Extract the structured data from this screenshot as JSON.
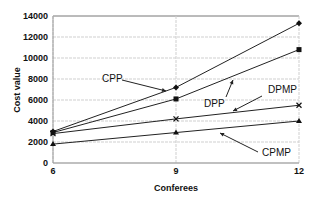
{
  "chart_data": {
    "type": "line",
    "title": "",
    "xlabel": "Conferees",
    "ylabel": "Cost value",
    "x": [
      6,
      9,
      12
    ],
    "xticks": [
      "6",
      "9",
      "12"
    ],
    "yticks": [
      "0",
      "2000",
      "4000",
      "6000",
      "8000",
      "10000",
      "12000",
      "14000"
    ],
    "ylim": [
      0,
      14000
    ],
    "grid": true,
    "legend_position": "inline-annotations",
    "series": [
      {
        "name": "CPP",
        "marker": "diamond",
        "values": [
          3000,
          7200,
          13300
        ]
      },
      {
        "name": "DPP",
        "marker": "square",
        "values": [
          2900,
          6100,
          10800
        ]
      },
      {
        "name": "DPMP",
        "marker": "x",
        "values": [
          2800,
          4200,
          5500
        ]
      },
      {
        "name": "CPMP",
        "marker": "triangle",
        "values": [
          1800,
          2900,
          4000
        ]
      }
    ],
    "annotations": [
      {
        "text": "CPP",
        "series": "CPP"
      },
      {
        "text": "DPP",
        "series": "DPP"
      },
      {
        "text": "DPMP",
        "series": "DPMP"
      },
      {
        "text": "CPMP",
        "series": "CPMP"
      }
    ]
  }
}
